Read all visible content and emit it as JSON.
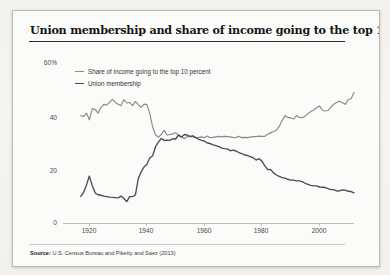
{
  "figure": {
    "title": "Union membership and share of income going to the top 10%",
    "source_prefix": "Source:",
    "source_text": "U.S. Census Bureau and Piketty and Saez (2013)"
  },
  "legend": [
    {
      "label": "Share of income going to the top 10 percent",
      "color": "#8a8a88",
      "name": "legend-income-share"
    },
    {
      "label": "Union membership",
      "color": "#4d4d4d",
      "name": "legend-union-membership"
    }
  ],
  "axes": {
    "y_ticks": [
      "60%",
      "40",
      "20",
      "0"
    ],
    "x_ticks": [
      "1920",
      "1940",
      "1960",
      "1980",
      "2000"
    ]
  },
  "colors": {
    "income_share": "#8a8a88",
    "union": "#4d4d4d",
    "axis": "#bfbdb9",
    "frame": "#b9b7b3",
    "title": "#151515"
  },
  "ghost_text": "subtitle of the rest of the nation, and the\nthat really was not in the interest of the\nmiddle class the share of income going to\nthose who the top 10 percent and the\nfortunate few, for a moment as organized\nmilitary power that was able to ensure\nbecause a business elite and a willing of a\npolicy.\n\nThe ebb and flow of union membership\nthat way into the back and forth of a\nworkers and the bottom of the ladder.",
  "chart_data": {
    "type": "line",
    "title": "Union membership and share of income going to the top 10%",
    "xlabel": "",
    "ylabel": "",
    "xlim": [
      1915,
      2012
    ],
    "ylim": [
      0,
      60
    ],
    "grid": false,
    "legend_position": "top-left",
    "x_ticks": [
      1920,
      1940,
      1960,
      1980,
      2000
    ],
    "y_ticks": [
      0,
      20,
      40,
      60
    ],
    "series": [
      {
        "name": "Share of income going to the top 10 percent",
        "color": "#8a8a88",
        "points": [
          [
            1917,
            40.3
          ],
          [
            1918,
            39.9
          ],
          [
            1919,
            41.2
          ],
          [
            1920,
            38.7
          ],
          [
            1921,
            42.9
          ],
          [
            1922,
            42.6
          ],
          [
            1923,
            41.2
          ],
          [
            1924,
            43.2
          ],
          [
            1925,
            44.5
          ],
          [
            1926,
            44.2
          ],
          [
            1927,
            45.2
          ],
          [
            1928,
            46.4
          ],
          [
            1929,
            45.2
          ],
          [
            1930,
            44.5
          ],
          [
            1931,
            44.0
          ],
          [
            1932,
            46.3
          ],
          [
            1933,
            45.0
          ],
          [
            1934,
            45.2
          ],
          [
            1935,
            44.0
          ],
          [
            1936,
            45.6
          ],
          [
            1937,
            44.4
          ],
          [
            1938,
            43.4
          ],
          [
            1939,
            44.6
          ],
          [
            1940,
            44.4
          ],
          [
            1941,
            41.0
          ],
          [
            1942,
            36.0
          ],
          [
            1943,
            33.0
          ],
          [
            1944,
            32.2
          ],
          [
            1945,
            33.2
          ],
          [
            1946,
            34.8
          ],
          [
            1947,
            33.0
          ],
          [
            1948,
            33.2
          ],
          [
            1949,
            33.4
          ],
          [
            1950,
            33.9
          ],
          [
            1951,
            32.8
          ],
          [
            1952,
            32.4
          ],
          [
            1953,
            31.6
          ],
          [
            1954,
            32.4
          ],
          [
            1955,
            32.4
          ],
          [
            1956,
            32.3
          ],
          [
            1957,
            32.0
          ],
          [
            1958,
            32.1
          ],
          [
            1959,
            32.3
          ],
          [
            1960,
            32.0
          ],
          [
            1961,
            32.6
          ],
          [
            1962,
            32.0
          ],
          [
            1963,
            32.1
          ],
          [
            1964,
            32.3
          ],
          [
            1965,
            32.5
          ],
          [
            1966,
            32.3
          ],
          [
            1967,
            32.5
          ],
          [
            1968,
            32.4
          ],
          [
            1969,
            32.3
          ],
          [
            1970,
            32.0
          ],
          [
            1971,
            32.1
          ],
          [
            1972,
            32.5
          ],
          [
            1973,
            32.0
          ],
          [
            1974,
            32.1
          ],
          [
            1975,
            32.0
          ],
          [
            1976,
            32.2
          ],
          [
            1977,
            32.4
          ],
          [
            1978,
            32.4
          ],
          [
            1979,
            32.6
          ],
          [
            1980,
            32.5
          ],
          [
            1981,
            32.5
          ],
          [
            1982,
            33.3
          ],
          [
            1983,
            33.8
          ],
          [
            1984,
            34.3
          ],
          [
            1985,
            34.8
          ],
          [
            1986,
            36.2
          ],
          [
            1987,
            38.4
          ],
          [
            1988,
            40.3
          ],
          [
            1989,
            39.6
          ],
          [
            1990,
            39.4
          ],
          [
            1991,
            39.0
          ],
          [
            1992,
            40.3
          ],
          [
            1993,
            39.6
          ],
          [
            1994,
            39.5
          ],
          [
            1995,
            40.1
          ],
          [
            1996,
            41.0
          ],
          [
            1997,
            41.8
          ],
          [
            1998,
            42.4
          ],
          [
            1999,
            43.2
          ],
          [
            2000,
            43.9
          ],
          [
            2001,
            42.3
          ],
          [
            2002,
            42.0
          ],
          [
            2003,
            42.2
          ],
          [
            2004,
            43.5
          ],
          [
            2005,
            44.6
          ],
          [
            2006,
            45.2
          ],
          [
            2007,
            45.7
          ],
          [
            2008,
            45.1
          ],
          [
            2009,
            44.5
          ],
          [
            2010,
            46.3
          ],
          [
            2011,
            46.6
          ],
          [
            2012,
            48.9
          ]
        ]
      },
      {
        "name": "Union membership",
        "color": "#4d4d4d",
        "points": [
          [
            1917,
            10.0
          ],
          [
            1918,
            11.5
          ],
          [
            1919,
            14.3
          ],
          [
            1920,
            17.6
          ],
          [
            1921,
            14.0
          ],
          [
            1922,
            11.3
          ],
          [
            1923,
            10.6
          ],
          [
            1924,
            10.4
          ],
          [
            1925,
            10.1
          ],
          [
            1926,
            9.9
          ],
          [
            1927,
            9.7
          ],
          [
            1928,
            9.6
          ],
          [
            1929,
            9.5
          ],
          [
            1930,
            9.4
          ],
          [
            1931,
            10.1
          ],
          [
            1932,
            9.2
          ],
          [
            1933,
            8.0
          ],
          [
            1934,
            9.9
          ],
          [
            1935,
            9.9
          ],
          [
            1936,
            10.5
          ],
          [
            1937,
            16.6
          ],
          [
            1938,
            19.2
          ],
          [
            1939,
            21.0
          ],
          [
            1940,
            22.0
          ],
          [
            1941,
            24.4
          ],
          [
            1942,
            25.2
          ],
          [
            1943,
            28.6
          ],
          [
            1944,
            30.3
          ],
          [
            1945,
            31.7
          ],
          [
            1946,
            31.0
          ],
          [
            1947,
            31.1
          ],
          [
            1948,
            31.0
          ],
          [
            1949,
            31.6
          ],
          [
            1950,
            31.5
          ],
          [
            1951,
            33.0
          ],
          [
            1952,
            32.2
          ],
          [
            1953,
            33.2
          ],
          [
            1954,
            33.0
          ],
          [
            1955,
            32.5
          ],
          [
            1956,
            32.7
          ],
          [
            1957,
            32.0
          ],
          [
            1958,
            31.4
          ],
          [
            1959,
            31.0
          ],
          [
            1960,
            30.7
          ],
          [
            1961,
            30.0
          ],
          [
            1962,
            29.8
          ],
          [
            1963,
            29.3
          ],
          [
            1964,
            29.0
          ],
          [
            1965,
            28.6
          ],
          [
            1966,
            28.1
          ],
          [
            1967,
            27.9
          ],
          [
            1968,
            27.8
          ],
          [
            1969,
            27.1
          ],
          [
            1970,
            27.3
          ],
          [
            1971,
            27.0
          ],
          [
            1972,
            26.4
          ],
          [
            1973,
            26.0
          ],
          [
            1974,
            25.5
          ],
          [
            1975,
            25.3
          ],
          [
            1976,
            24.9
          ],
          [
            1977,
            24.4
          ],
          [
            1978,
            23.6
          ],
          [
            1979,
            24.1
          ],
          [
            1980,
            23.2
          ],
          [
            1981,
            21.4
          ],
          [
            1982,
            20.0
          ],
          [
            1983,
            20.1
          ],
          [
            1984,
            18.8
          ],
          [
            1985,
            18.0
          ],
          [
            1986,
            17.5
          ],
          [
            1987,
            17.0
          ],
          [
            1988,
            16.8
          ],
          [
            1989,
            16.4
          ],
          [
            1990,
            16.1
          ],
          [
            1991,
            16.1
          ],
          [
            1992,
            15.8
          ],
          [
            1993,
            15.8
          ],
          [
            1994,
            15.5
          ],
          [
            1995,
            14.9
          ],
          [
            1996,
            14.5
          ],
          [
            1997,
            14.1
          ],
          [
            1998,
            13.9
          ],
          [
            1999,
            13.9
          ],
          [
            2000,
            13.5
          ],
          [
            2001,
            13.4
          ],
          [
            2002,
            13.3
          ],
          [
            2003,
            12.9
          ],
          [
            2004,
            12.5
          ],
          [
            2005,
            12.5
          ],
          [
            2006,
            12.0
          ],
          [
            2007,
            12.1
          ],
          [
            2008,
            12.4
          ],
          [
            2009,
            12.3
          ],
          [
            2010,
            11.9
          ],
          [
            2011,
            11.8
          ],
          [
            2012,
            11.3
          ]
        ]
      }
    ]
  }
}
